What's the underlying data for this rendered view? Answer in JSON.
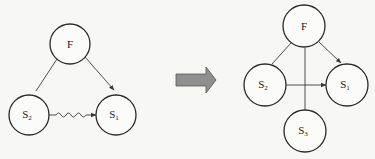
{
  "diagram": {
    "before": {
      "nodes": [
        {
          "id": "F",
          "label": "F",
          "sub": ""
        },
        {
          "id": "S2",
          "label": "S",
          "sub": "2"
        },
        {
          "id": "S1",
          "label": "S",
          "sub": "1"
        }
      ],
      "edges": [
        {
          "from": "F",
          "to": "S2",
          "style": "line"
        },
        {
          "from": "F",
          "to": "S1",
          "style": "arrow"
        },
        {
          "from": "S2",
          "to": "S1",
          "style": "wavy-arrow"
        }
      ]
    },
    "transition": {
      "icon": "right-arrow-icon",
      "color": "#8a8a8a"
    },
    "after": {
      "nodes": [
        {
          "id": "F",
          "label": "F",
          "sub": ""
        },
        {
          "id": "S2",
          "label": "S",
          "sub": "2"
        },
        {
          "id": "S1",
          "label": "S",
          "sub": "1"
        },
        {
          "id": "S3",
          "label": "S",
          "sub": "3"
        }
      ],
      "edges": [
        {
          "from": "F",
          "to": "S2",
          "style": "line"
        },
        {
          "from": "F",
          "to": "S1",
          "style": "arrow"
        },
        {
          "from": "F",
          "to": "S3",
          "style": "line"
        },
        {
          "from": "S2",
          "to": "S1",
          "style": "arrow"
        }
      ]
    }
  }
}
